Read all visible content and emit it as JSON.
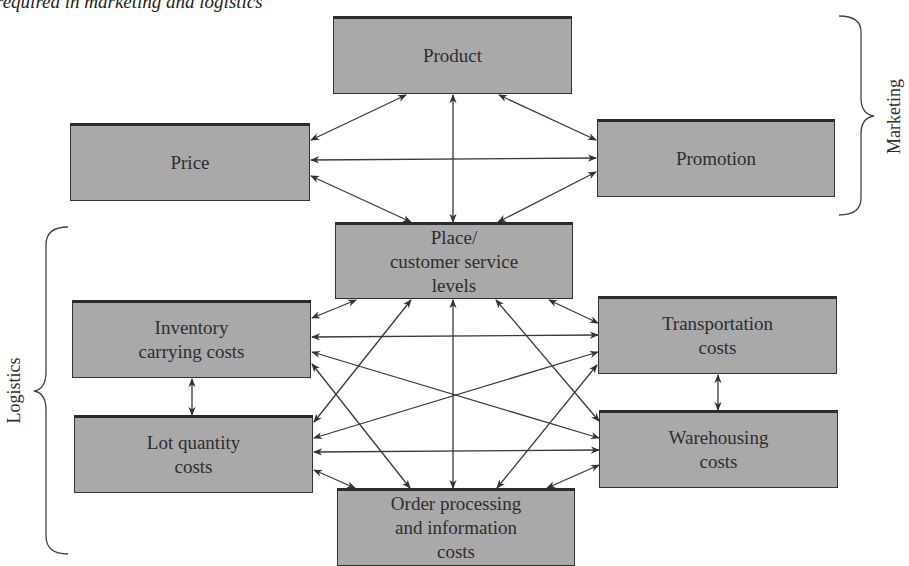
{
  "caption": "required in marketing and logistics",
  "groups": {
    "marketing": "Marketing",
    "logistics": "Logistics"
  },
  "boxes": {
    "product": "Product",
    "price": "Price",
    "promotion": "Promotion",
    "place": "Place/\ncustomer service\nlevels",
    "inventory": "Inventory\ncarrying costs",
    "transportation": "Transportation\ncosts",
    "lot": "Lot quantity\ncosts",
    "warehousing": "Warehousing\ncosts",
    "order": "Order processing\nand information\ncosts"
  },
  "connections": [
    [
      "product",
      "price"
    ],
    [
      "product",
      "place"
    ],
    [
      "product",
      "promotion"
    ],
    [
      "price",
      "promotion"
    ],
    [
      "price",
      "place"
    ],
    [
      "promotion",
      "place"
    ],
    [
      "place",
      "inventory"
    ],
    [
      "place",
      "lot"
    ],
    [
      "place",
      "order"
    ],
    [
      "place",
      "warehousing"
    ],
    [
      "place",
      "transportation"
    ],
    [
      "inventory",
      "transportation"
    ],
    [
      "inventory",
      "warehousing"
    ],
    [
      "inventory",
      "order"
    ],
    [
      "inventory",
      "lot"
    ],
    [
      "transportation",
      "lot"
    ],
    [
      "transportation",
      "order"
    ],
    [
      "transportation",
      "warehousing"
    ],
    [
      "lot",
      "warehousing"
    ],
    [
      "lot",
      "order"
    ],
    [
      "warehousing",
      "order"
    ]
  ],
  "colors": {
    "box_fill": "#a9a9a9",
    "box_border": "#2b2b2b",
    "arrow": "#333333"
  }
}
